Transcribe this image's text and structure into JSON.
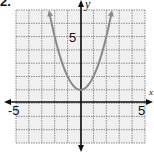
{
  "problem": {
    "number": "2."
  },
  "chart_data": {
    "type": "line",
    "title": "",
    "xlabel": "x",
    "ylabel": "y",
    "xlim": [
      -5,
      5
    ],
    "ylim": [
      -3,
      7
    ],
    "grid": true,
    "x_tick_labels": [
      "-5",
      "5"
    ],
    "y_tick_labels": [
      "5"
    ],
    "series": [
      {
        "name": "y = x^2 + 1",
        "equation": "y = x^2 + 1",
        "vertex": [
          0,
          1
        ],
        "x": [
          -2.4,
          -2,
          -1.5,
          -1,
          -0.5,
          0,
          0.5,
          1,
          1.5,
          2,
          2.4
        ],
        "y": [
          6.76,
          5,
          3.25,
          2,
          1.25,
          1,
          1.25,
          2,
          3.25,
          5,
          6.76
        ],
        "arrows_at_ends": true,
        "color": "#8a8a8a"
      }
    ]
  },
  "labels": {
    "x_axis_name": "x",
    "y_axis_name": "y",
    "x_min_tick": "-5",
    "x_max_tick": "5",
    "y_tick": "5"
  },
  "colors": {
    "grid_fill": "#f0f0f0",
    "grid_line": "#8c8c8c",
    "axis": "#111111",
    "curve": "#8a8a8a"
  }
}
